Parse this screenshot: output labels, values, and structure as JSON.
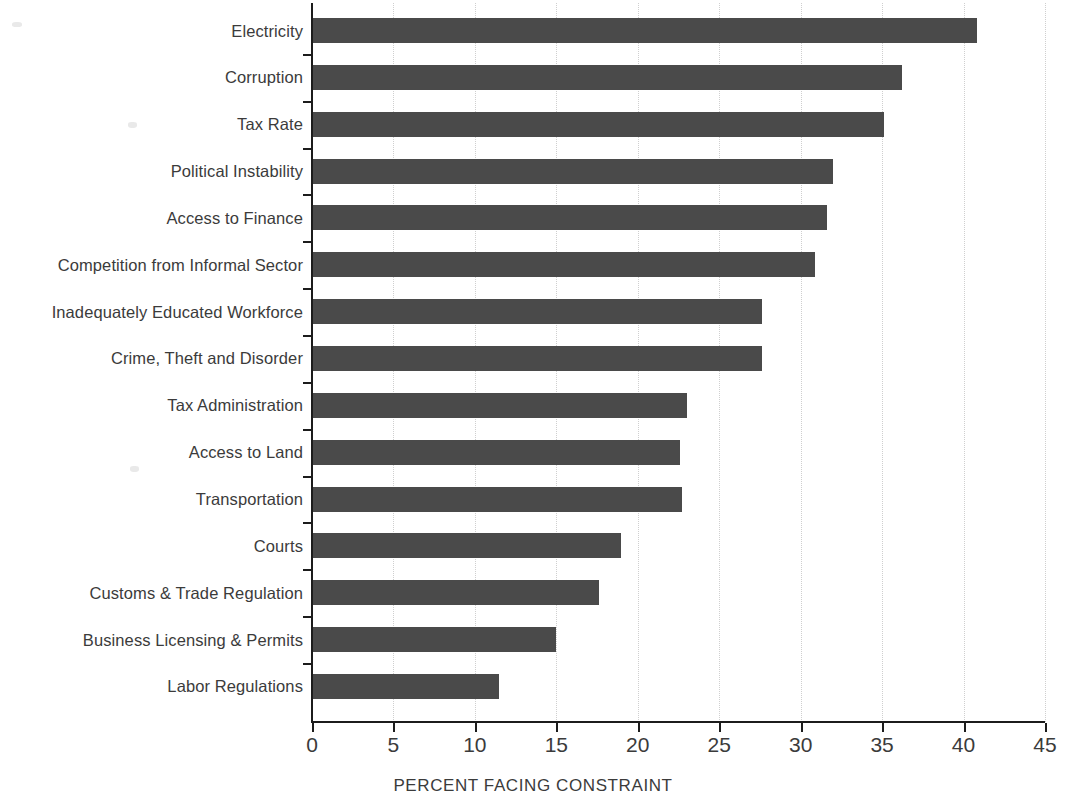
{
  "chart_data": {
    "type": "bar",
    "orientation": "horizontal",
    "title": "",
    "xlabel": "PERCENT FACING CONSTRAINT",
    "ylabel": "",
    "xlim": [
      0,
      45
    ],
    "xticks": [
      0,
      5,
      10,
      15,
      20,
      25,
      30,
      35,
      40,
      45
    ],
    "xtick_labels": [
      "0",
      "5",
      "10",
      "15",
      "20",
      "25",
      "30",
      "35",
      "40",
      "45"
    ],
    "grid": "vertical-dotted",
    "legend": "none",
    "bar_color": "#4a4a4a",
    "axis_color": "#1c1c1c",
    "text_color": "#3b3b3b",
    "categories": [
      "Electricity",
      "Corruption",
      "Tax Rate",
      "Political Instability",
      "Access to Finance",
      "Competition from Informal Sector",
      "Inadequately Educated Workforce",
      "Crime, Theft and Disorder",
      "Tax Administration",
      "Access to Land",
      "Transportation",
      "Courts",
      "Customs & Trade Regulation",
      "Business Licensing & Permits",
      "Labor Regulations"
    ],
    "values": [
      40.8,
      36.2,
      35.1,
      32.0,
      31.6,
      30.9,
      27.6,
      27.6,
      23.0,
      22.6,
      22.7,
      19.0,
      17.6,
      15.0,
      11.5
    ]
  }
}
